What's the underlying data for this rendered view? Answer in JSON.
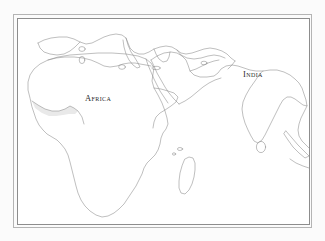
{
  "figure": {
    "kind": "outline-map",
    "background_color": "#fbfbfb",
    "paper_color": "#ffffff",
    "coastline_color": "#8a8a8a",
    "frame_outer_color": "#b4b4b4",
    "frame_inner_color": "#8d8d8d",
    "shaded_region_color": "#e9e9e9",
    "label_color": "#2a2a2a"
  },
  "labels": {
    "africa": "Africa",
    "india": "India"
  },
  "regions_depicted": [
    "Africa",
    "India",
    "Arabian Peninsula",
    "Mediterranean Europe",
    "Madagascar",
    "Sri Lanka",
    "Southeast Asia"
  ]
}
